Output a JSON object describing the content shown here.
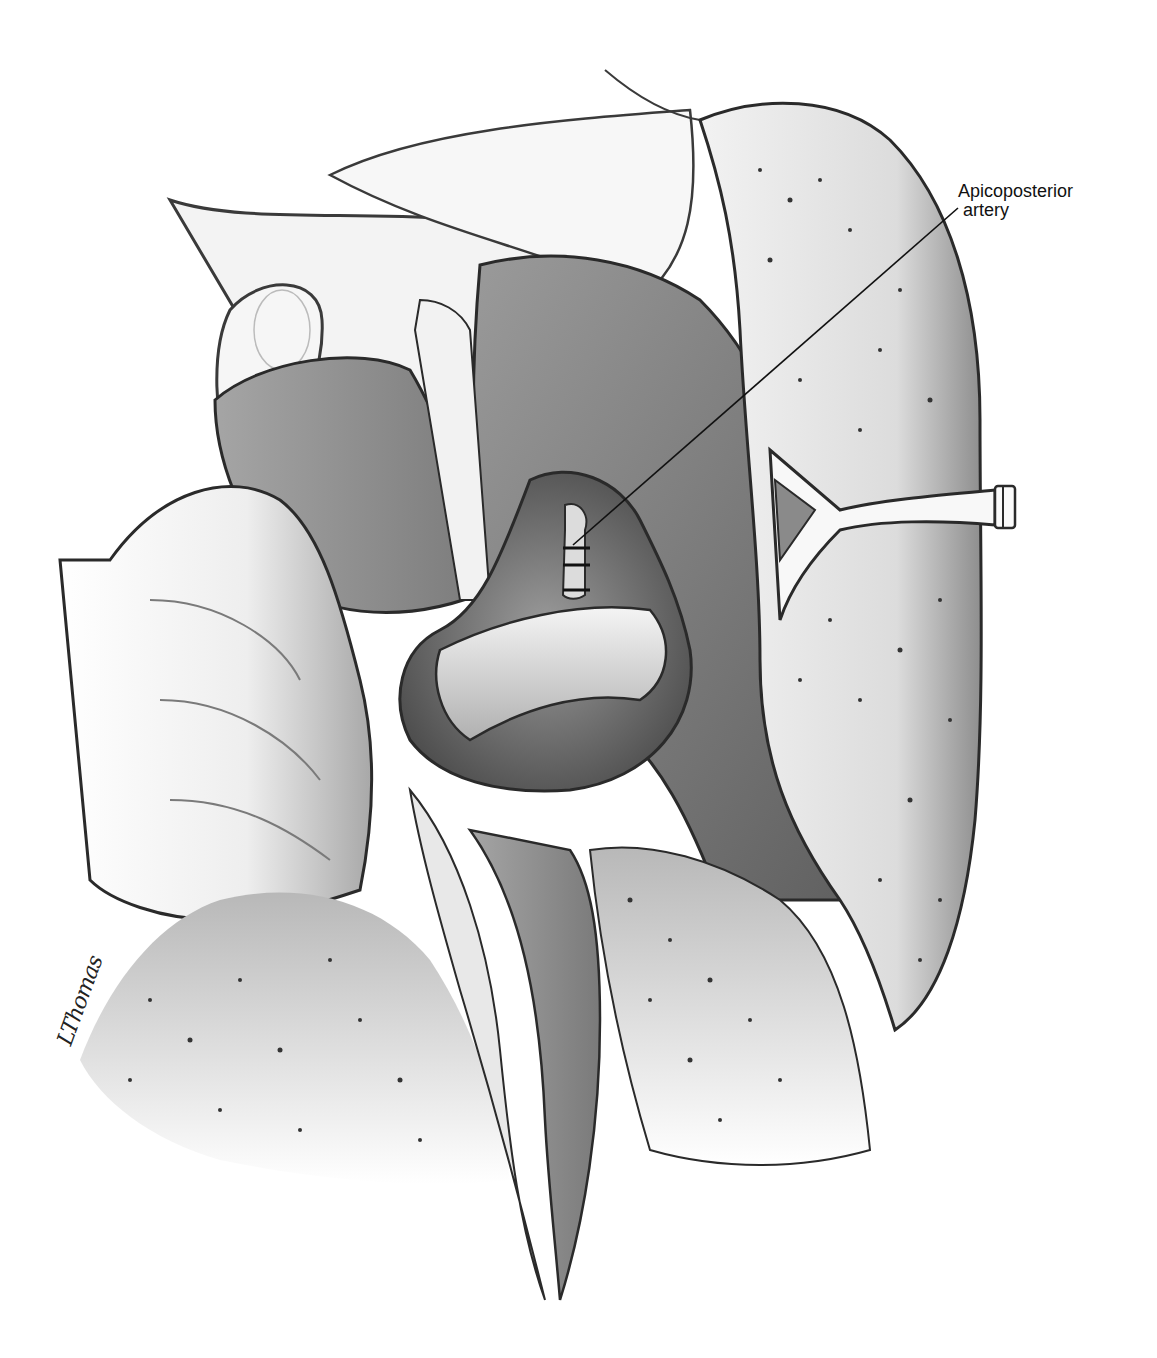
{
  "illustration": {
    "subject": "Surgical view of left upper lobe hilum with ligated apicoposterior artery",
    "palette": {
      "background": "#ffffff",
      "outline": "#2a2a2a",
      "tissue_dark": "#6e6e6e",
      "tissue_mid": "#8c8c8c",
      "tissue_light": "#d8d8d8",
      "lung_fill": "#e6e6e6",
      "speckle": "#333333"
    }
  },
  "annotations": [
    {
      "id": "apicoposterior-artery",
      "line1": "Apicoposterior",
      "line2": "artery",
      "leader": {
        "x1": 573,
        "y1": 545,
        "x2": 958,
        "y2": 208
      }
    }
  ],
  "signature": {
    "text": "LThomas"
  }
}
